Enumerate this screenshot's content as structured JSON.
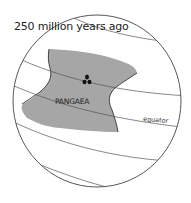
{
  "title": "250 million years ago",
  "labels": {
    "continent": "PANGAEA",
    "equator": "equator"
  },
  "colors": {
    "land": "#a6a6a6",
    "outline": "#444444",
    "background": "#ffffff"
  },
  "icons": {
    "marker": "fossil-cluster-icon"
  }
}
